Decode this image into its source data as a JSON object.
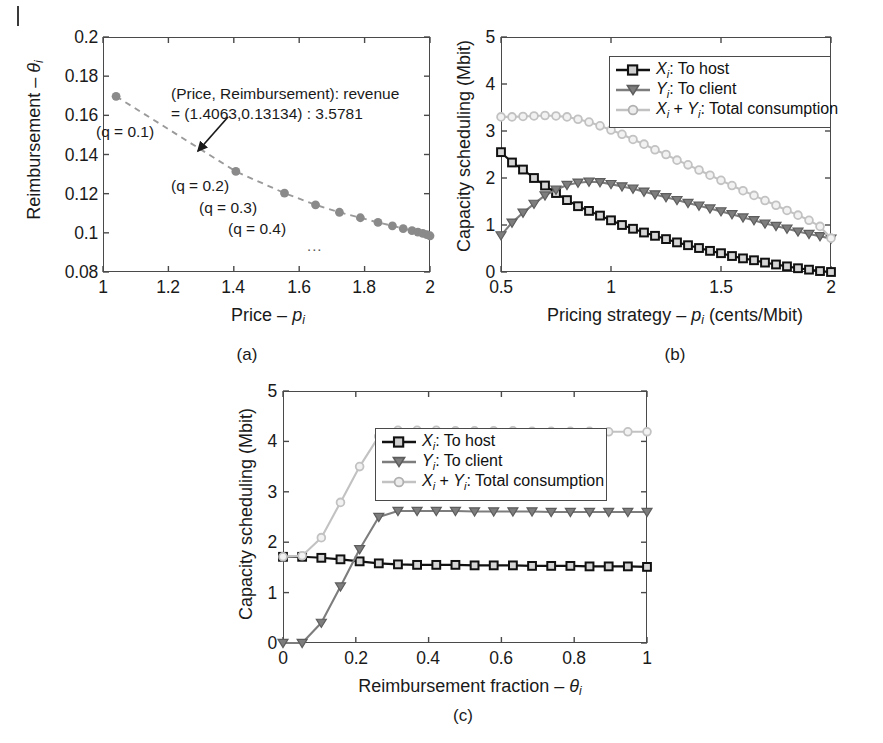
{
  "figure": {
    "panel_captions": [
      "(a)",
      "(b)",
      "(c)"
    ]
  },
  "panel_a": {
    "caption": "(a)",
    "xlabel_prefix": "Price – ",
    "xlabel_symbol": "p",
    "xlabel_sub": "i",
    "ylabel_prefix": "Reimbursement – ",
    "ylabel_symbol": "θ",
    "ylabel_sub": "i",
    "x_ticks": [
      "1",
      "1.2",
      "1.4",
      "1.6",
      "1.8",
      "2"
    ],
    "y_ticks": [
      "0.08",
      "0.1",
      "0.12",
      "0.14",
      "0.16",
      "0.18",
      "0.2"
    ],
    "annotation_line1": "(Price, Reimbursement): revenue",
    "annotation_line2": "= (1.4063,0.13134) : 3.5781",
    "point_labels": [
      "(q = 0.1)",
      "(q = 0.2)",
      "(q = 0.3)",
      "(q = 0.4)"
    ],
    "ellipsis": "...",
    "marker_color": "#8a8a8a",
    "line_color": "#9a9a9a"
  },
  "panel_b": {
    "caption": "(b)",
    "xlabel": "Pricing strategy – p_i (cents/Mbit)",
    "xlabel_prefix": "Pricing strategy – ",
    "xlabel_symbol": "p",
    "xlabel_sub": "i",
    "xlabel_suffix": " (cents/Mbit)",
    "ylabel": "Capacity scheduling (Mbit)",
    "x_ticks": [
      "0.5",
      "1",
      "1.5",
      "2"
    ],
    "y_ticks": [
      "0",
      "1",
      "2",
      "3",
      "4",
      "5"
    ],
    "legend": [
      {
        "symbol": "X",
        "sub": "i",
        "label": ": To host",
        "marker": "square",
        "color": "#111111"
      },
      {
        "symbol": "Y",
        "sub": "i",
        "label": ": To client",
        "marker": "triangle-down",
        "color": "#7d7d7d"
      },
      {
        "symbol": "X",
        "sub": "i",
        "symbol2": "Y",
        "sub2": "i",
        "label": ": Total consumption",
        "marker": "circle",
        "color": "#c2c2c2",
        "plus": " + "
      }
    ]
  },
  "panel_c": {
    "caption": "(c)",
    "xlabel_prefix": "Reimbursement fraction – ",
    "xlabel_symbol": "θ",
    "xlabel_sub": "i",
    "ylabel": "Capacity scheduling (Mbit)",
    "x_ticks": [
      "0",
      "0.2",
      "0.4",
      "0.6",
      "0.8",
      "1"
    ],
    "y_ticks": [
      "0",
      "1",
      "2",
      "3",
      "4",
      "5"
    ],
    "legend": [
      {
        "symbol": "X",
        "sub": "i",
        "label": ": To host",
        "marker": "square",
        "color": "#111111"
      },
      {
        "symbol": "Y",
        "sub": "i",
        "label": ": To client",
        "marker": "triangle-down",
        "color": "#7d7d7d"
      },
      {
        "symbol": "X",
        "sub": "i",
        "symbol2": "Y",
        "sub2": "i",
        "label": ": Total consumption",
        "marker": "circle",
        "color": "#c2c2c2",
        "plus": " + "
      }
    ]
  },
  "chart_data": [
    {
      "id": "panel_a",
      "type": "scatter",
      "title": "",
      "xlabel": "Price - p_i",
      "ylabel": "Reimbursement - theta_i",
      "xlim": [
        1,
        2
      ],
      "ylim": [
        0.08,
        0.2
      ],
      "xticks": [
        1,
        1.2,
        1.4,
        1.6,
        1.8,
        2
      ],
      "yticks": [
        0.08,
        0.1,
        0.12,
        0.14,
        0.16,
        0.18,
        0.2
      ],
      "grid": false,
      "legend": "none",
      "line_style": "dashed",
      "annotations": [
        {
          "text": "(Price, Reimbursement): revenue = (1.4063,0.13134) : 3.5781",
          "points_to": [
            1.4063,
            0.13134
          ]
        },
        {
          "text": "(q = 0.1)",
          "near": [
            1.04,
            0.1697
          ]
        },
        {
          "text": "(q = 0.2)",
          "near": [
            1.4063,
            0.13134
          ]
        },
        {
          "text": "(q = 0.3)",
          "near": [
            1.555,
            0.1203
          ]
        },
        {
          "text": "(q = 0.4)",
          "near": [
            1.65,
            0.1143
          ]
        },
        {
          "text": "...",
          "near": [
            1.78,
            0.097
          ]
        }
      ],
      "series": [
        {
          "name": "q sweep",
          "x": [
            1.04,
            1.4063,
            1.555,
            1.65,
            1.723,
            1.787,
            1.841,
            1.885,
            1.918,
            1.945,
            1.963,
            1.978,
            1.99,
            2.0
          ],
          "y": [
            0.1697,
            0.13134,
            0.1203,
            0.1143,
            0.1105,
            0.1077,
            0.1053,
            0.1036,
            0.1022,
            0.1011,
            0.1004,
            0.0997,
            0.0991,
            0.0985
          ]
        }
      ]
    },
    {
      "id": "panel_b",
      "type": "line",
      "title": "",
      "xlabel": "Pricing strategy - p_i (cents/Mbit)",
      "ylabel": "Capacity scheduling (Mbit)",
      "xlim": [
        0.5,
        2
      ],
      "ylim": [
        0,
        5
      ],
      "xticks": [
        0.5,
        1,
        1.5,
        2
      ],
      "yticks": [
        0,
        1,
        2,
        3,
        4,
        5
      ],
      "grid": false,
      "legend": "upper right",
      "x": [
        0.5,
        0.55,
        0.6,
        0.65,
        0.7,
        0.75,
        0.8,
        0.85,
        0.9,
        0.95,
        1.0,
        1.05,
        1.1,
        1.15,
        1.2,
        1.25,
        1.3,
        1.35,
        1.4,
        1.45,
        1.5,
        1.55,
        1.6,
        1.65,
        1.7,
        1.75,
        1.8,
        1.85,
        1.9,
        1.95,
        2.0
      ],
      "series": [
        {
          "name": "X_i: To host",
          "marker": "square",
          "color": "#111111",
          "values": [
            2.55,
            2.33,
            2.18,
            2.0,
            1.84,
            1.68,
            1.53,
            1.4,
            1.3,
            1.2,
            1.1,
            1.0,
            0.92,
            0.84,
            0.77,
            0.7,
            0.63,
            0.57,
            0.51,
            0.45,
            0.4,
            0.34,
            0.29,
            0.25,
            0.2,
            0.16,
            0.12,
            0.08,
            0.05,
            0.02,
            0.0
          ]
        },
        {
          "name": "Y_i: To client",
          "marker": "triangle-down",
          "color": "#7d7d7d",
          "values": [
            0.78,
            1.05,
            1.26,
            1.45,
            1.63,
            1.75,
            1.85,
            1.9,
            1.92,
            1.91,
            1.87,
            1.82,
            1.77,
            1.71,
            1.65,
            1.59,
            1.53,
            1.47,
            1.41,
            1.35,
            1.29,
            1.23,
            1.16,
            1.1,
            1.03,
            0.98,
            0.92,
            0.86,
            0.81,
            0.76,
            0.71
          ]
        },
        {
          "name": "X_i + Y_i: Total consumption",
          "marker": "circle",
          "color": "#c2c2c2",
          "values": [
            3.3,
            3.3,
            3.31,
            3.32,
            3.33,
            3.32,
            3.3,
            3.25,
            3.19,
            3.11,
            3.02,
            2.93,
            2.82,
            2.72,
            2.6,
            2.5,
            2.38,
            2.28,
            2.17,
            2.06,
            1.95,
            1.84,
            1.73,
            1.63,
            1.52,
            1.42,
            1.31,
            1.21,
            1.1,
            0.97,
            0.72
          ]
        }
      ]
    },
    {
      "id": "panel_c",
      "type": "line",
      "title": "",
      "xlabel": "Reimbursement fraction - theta_i",
      "ylabel": "Capacity scheduling (Mbit)",
      "xlim": [
        0,
        1
      ],
      "ylim": [
        0,
        5
      ],
      "xticks": [
        0,
        0.2,
        0.4,
        0.6,
        0.8,
        1
      ],
      "yticks": [
        0,
        1,
        2,
        3,
        4,
        5
      ],
      "grid": false,
      "legend": "upper center",
      "x": [
        0.0,
        0.0526,
        0.1053,
        0.1579,
        0.2105,
        0.2632,
        0.3158,
        0.3684,
        0.4211,
        0.4737,
        0.5263,
        0.5789,
        0.6316,
        0.6842,
        0.7368,
        0.7895,
        0.8421,
        0.8947,
        0.9474,
        1.0
      ],
      "series": [
        {
          "name": "X_i: To host",
          "marker": "square",
          "color": "#111111",
          "values": [
            1.71,
            1.71,
            1.69,
            1.66,
            1.62,
            1.58,
            1.56,
            1.55,
            1.55,
            1.55,
            1.54,
            1.54,
            1.54,
            1.53,
            1.53,
            1.53,
            1.52,
            1.52,
            1.52,
            1.51
          ]
        },
        {
          "name": "Y_i: To client",
          "marker": "triangle-down",
          "color": "#7d7d7d",
          "values": [
            0.0,
            0.0,
            0.4,
            1.12,
            1.86,
            2.5,
            2.62,
            2.62,
            2.62,
            2.62,
            2.61,
            2.61,
            2.61,
            2.61,
            2.6,
            2.6,
            2.6,
            2.6,
            2.6,
            2.6
          ]
        },
        {
          "name": "X_i + Y_i: Total consumption",
          "marker": "circle",
          "color": "#c2c2c2",
          "values": [
            1.71,
            1.73,
            2.09,
            2.79,
            3.5,
            4.1,
            4.22,
            4.22,
            4.22,
            4.21,
            4.21,
            4.21,
            4.21,
            4.2,
            4.2,
            4.2,
            4.2,
            4.19,
            4.19,
            4.19
          ]
        }
      ]
    }
  ]
}
